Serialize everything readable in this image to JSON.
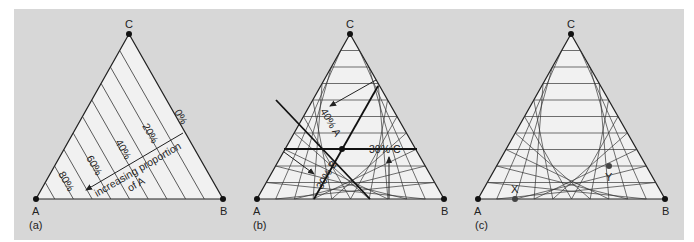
{
  "figure": {
    "colors": {
      "background": "#d7d7d7",
      "triangle_fill": "#f1f1f1",
      "line": "#222222",
      "grid": "#333333"
    },
    "panels": [
      {
        "id": "a",
        "caption": "(a)",
        "vertices": {
          "A": "A",
          "B": "B",
          "C": "C"
        },
        "hatch_labels": [
          "0%",
          "20%",
          "40%",
          "60%",
          "80%"
        ],
        "arrow_text_line1": "increasing proportion",
        "arrow_text_line2": "of A"
      },
      {
        "id": "b",
        "caption": "(b)",
        "vertices": {
          "A": "A",
          "B": "B",
          "C": "C"
        },
        "labels": {
          "a": "40% A",
          "b": "30% B",
          "c": "30% C"
        }
      },
      {
        "id": "c",
        "caption": "(c)",
        "vertices": {
          "A": "A",
          "B": "B",
          "C": "C"
        },
        "points": {
          "x": "X",
          "y": "Y"
        }
      }
    ]
  }
}
